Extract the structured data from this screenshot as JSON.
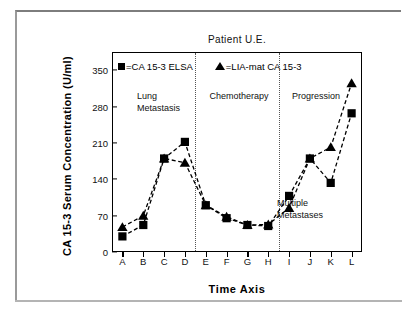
{
  "figure": {
    "outer_border_color": "#9a9a9a",
    "background": "#ffffff"
  },
  "chart_data": {
    "type": "line",
    "title": "Patient U.E.",
    "xlabel": "Time Axis",
    "ylabel": "CA 15-3 Serum Concentration (U/ml)",
    "categories": [
      "A",
      "B",
      "C",
      "D",
      "E",
      "F",
      "G",
      "H",
      "I",
      "J",
      "K",
      "L"
    ],
    "ylim": [
      0,
      385
    ],
    "yticks": [
      0,
      70,
      140,
      210,
      280,
      350
    ],
    "ytick_labels": [
      "0",
      "70",
      "140",
      "210",
      "280",
      "350"
    ],
    "grid": false,
    "legend_position": "top-inside",
    "series": [
      {
        "name": "=CA 15-3 ELSA",
        "marker": "square",
        "linestyle": "dashed",
        "color": "#000000",
        "values": [
          30,
          52,
          180,
          212,
          90,
          65,
          52,
          50,
          108,
          180,
          133,
          267
        ]
      },
      {
        "name": "=LIA-mat CA 15-3",
        "marker": "triangle",
        "linestyle": "dashed",
        "color": "#000000",
        "values": [
          48,
          70,
          180,
          172,
          90,
          68,
          52,
          53,
          85,
          180,
          202,
          325
        ]
      }
    ],
    "annotations": [
      {
        "id": "lung-metastasis",
        "lines": [
          "Lung",
          "Metastasis"
        ],
        "x_frac": 0.1,
        "y_value": 300
      },
      {
        "id": "chemotherapy",
        "lines": [
          "Chemotherapy"
        ],
        "x_frac": 0.39,
        "y_value": 300
      },
      {
        "id": "progression",
        "lines": [
          "Progression"
        ],
        "x_frac": 0.72,
        "y_value": 300
      },
      {
        "id": "multiple-metastases",
        "lines": [
          "Multiple",
          "Metastases"
        ],
        "x_frac": 0.66,
        "y_value": 95
      }
    ],
    "dividers": [
      {
        "id": "divider-d-e",
        "after_category": "D",
        "style": "dotted"
      },
      {
        "id": "divider-h-i",
        "after_category": "H",
        "style": "dotted"
      }
    ]
  }
}
